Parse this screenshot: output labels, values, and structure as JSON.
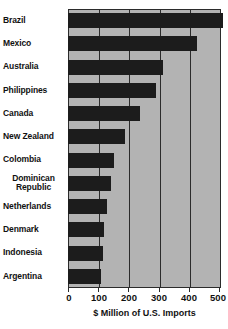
{
  "chart_data": {
    "type": "bar",
    "orientation": "horizontal",
    "title": "",
    "xlabel": "$ Million of U.S. Imports",
    "ylabel": "",
    "xlim": [
      0,
      500
    ],
    "xticks": [
      0,
      100,
      200,
      300,
      400,
      500
    ],
    "xticklabels": [
      "0",
      "100",
      "200",
      "300",
      "400",
      "500"
    ],
    "grid": true,
    "grid_axis": "x",
    "legend": null,
    "categories": [
      "Brazil",
      "Mexico",
      "Australia",
      "Philippines",
      "Canada",
      "New Zealand",
      "Colombia",
      "Dominican\nRepublic",
      "Netherlands",
      "Denmark",
      "Indonesia",
      "Argentina"
    ],
    "values": [
      507,
      421,
      309,
      286,
      236,
      187,
      150,
      140,
      127,
      117,
      113,
      107
    ],
    "bar_color": "#1c1c1c",
    "plot_background": "#b3b3b3",
    "axis_color": "#2b2b2b"
  }
}
